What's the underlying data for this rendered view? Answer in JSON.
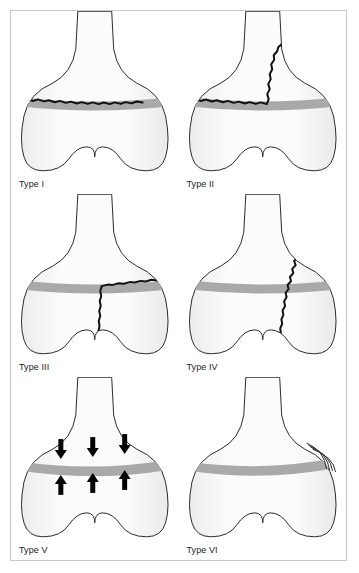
{
  "figure": {
    "frame_border_color": "#c9c9c9",
    "background_color": "#ffffff"
  },
  "colors": {
    "bone_fill_light": "#fbfbfb",
    "bone_fill_shade": "#ededed",
    "bone_outline": "#2b2b2b",
    "physis_band": "#a9a9a9",
    "fracture_line": "#111111",
    "arrow": "#000000",
    "label_text": "#1b1b1b"
  },
  "panels": [
    {
      "id": "type-1",
      "label": "Type I",
      "description": "Fracture through the physis only",
      "fracture": "transverse-through-physis",
      "has_arrows": false,
      "has_bridge": false
    },
    {
      "id": "type-2",
      "label": "Type II",
      "description": "Fracture through physis exiting into metaphysis",
      "fracture": "physis-plus-metaphysis",
      "has_arrows": false,
      "has_bridge": false
    },
    {
      "id": "type-3",
      "label": "Type III",
      "description": "Fracture through physis exiting into epiphysis",
      "fracture": "physis-plus-epiphysis",
      "has_arrows": false,
      "has_bridge": false
    },
    {
      "id": "type-4",
      "label": "Type IV",
      "description": "Fracture crossing metaphysis, physis and epiphysis",
      "fracture": "metaphysis-physis-epiphysis",
      "has_arrows": false,
      "has_bridge": false
    },
    {
      "id": "type-5",
      "label": "Type V",
      "description": "Crush injury of the physis, compression forces shown by arrows",
      "fracture": "crush-compression",
      "has_arrows": true,
      "arrow_count_down": 3,
      "arrow_count_up": 3,
      "has_bridge": false
    },
    {
      "id": "type-6",
      "label": "Type VI",
      "description": "Injury to the perichondral ring / peripheral physis",
      "fracture": "perichondral-ring-injury",
      "has_arrows": false,
      "has_bridge": true,
      "bridge_arc_count": 4
    }
  ]
}
